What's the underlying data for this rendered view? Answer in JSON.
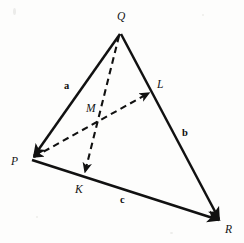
{
  "figure": {
    "background_color": "#fdfdfc",
    "stroke_color": "#111111",
    "width": 244,
    "height": 243
  },
  "vertices": [
    {
      "id": "P",
      "label": "P",
      "x": 30,
      "y": 158,
      "label_x": 11,
      "label_y": 156
    },
    {
      "id": "Q",
      "label": "Q",
      "x": 120,
      "y": 32,
      "label_x": 117,
      "label_y": 11
    },
    {
      "id": "R",
      "label": "R",
      "x": 222,
      "y": 222,
      "label_x": 225,
      "label_y": 224
    }
  ],
  "points": [
    {
      "id": "L",
      "label": "L",
      "x": 152,
      "y": 90,
      "label_x": 157,
      "label_y": 79,
      "on_segment": "QR"
    },
    {
      "id": "M",
      "label": "M",
      "x": 102,
      "y": 113,
      "label_x": 86,
      "label_y": 103,
      "on_segment": "intersection"
    },
    {
      "id": "K",
      "label": "K",
      "x": 85,
      "y": 177,
      "label_x": 75,
      "label_y": 184,
      "on_segment": "PR"
    }
  ],
  "vector_labels": [
    {
      "id": "a",
      "label": "a",
      "x": 64,
      "y": 81,
      "edge": "QP"
    },
    {
      "id": "b",
      "label": "b",
      "x": 182,
      "y": 128,
      "edge": "QR"
    },
    {
      "id": "c",
      "label": "c",
      "x": 120,
      "y": 195,
      "edge": "PR"
    }
  ],
  "solid_edges": [
    {
      "id": "edge-a-QP",
      "from": "Q",
      "to": "P",
      "x1": 120,
      "y1": 34,
      "x2": 32,
      "y2": 157,
      "arrow_at_end": true,
      "label": "a"
    },
    {
      "id": "edge-b-QR",
      "from": "Q",
      "to": "R",
      "x1": 121,
      "y1": 34,
      "x2": 220,
      "y2": 220,
      "arrow_at_end": true,
      "label": "b"
    },
    {
      "id": "edge-c-PR",
      "from": "P",
      "to": "R",
      "x1": 32,
      "y1": 160,
      "x2": 220,
      "y2": 221,
      "arrow_at_end": true,
      "label": "c"
    }
  ],
  "dashed_edges": [
    {
      "id": "cevian-PL",
      "from": "P",
      "to": "L",
      "x1": 32,
      "y1": 158,
      "x2": 150,
      "y2": 92,
      "arrow_at_end": true,
      "arrow_at_start": true
    },
    {
      "id": "cevian-QK",
      "from": "Q",
      "to": "K",
      "x1": 119,
      "y1": 35,
      "x2": 85,
      "y2": 175,
      "arrow_at_end": true,
      "arrow_at_start": false
    }
  ]
}
